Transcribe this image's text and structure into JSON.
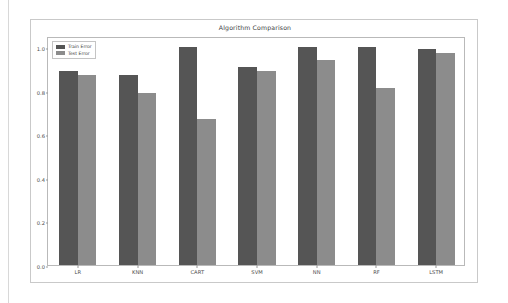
{
  "figure": {
    "background_color": "#ffffff",
    "frame_color": "#c9c9c9",
    "axes_frame_color": "#b9b9b9"
  },
  "legend": {
    "position": "upper-left",
    "entries": [
      {
        "label": "Train Error",
        "color": "#555555",
        "swatch_name": "legend-swatch-train"
      },
      {
        "label": "Test Error",
        "color": "#8c8c8c",
        "swatch_name": "legend-swatch-test"
      }
    ]
  },
  "chart_data": {
    "type": "bar",
    "title": "Algorithm Comparison",
    "xlabel": "",
    "ylabel": "",
    "categories": [
      "LR",
      "KNN",
      "CART",
      "SVM",
      "NN",
      "RF",
      "LSTM"
    ],
    "series": [
      {
        "name": "Train Error",
        "color": "#555555",
        "values": [
          0.89,
          0.87,
          1.0,
          0.91,
          1.0,
          1.0,
          0.99
        ]
      },
      {
        "name": "Test Error",
        "color": "#8c8c8c",
        "values": [
          0.87,
          0.79,
          0.67,
          0.89,
          0.94,
          0.81,
          0.97
        ]
      }
    ],
    "ylim": [
      0.0,
      1.05
    ],
    "yticks": [
      0.0,
      0.2,
      0.4,
      0.6,
      0.8,
      1.0
    ],
    "ytick_labels": [
      "0.0",
      "0.2",
      "0.4",
      "0.6",
      "0.8",
      "1.0"
    ],
    "grid": false,
    "legend_position": "upper left"
  }
}
